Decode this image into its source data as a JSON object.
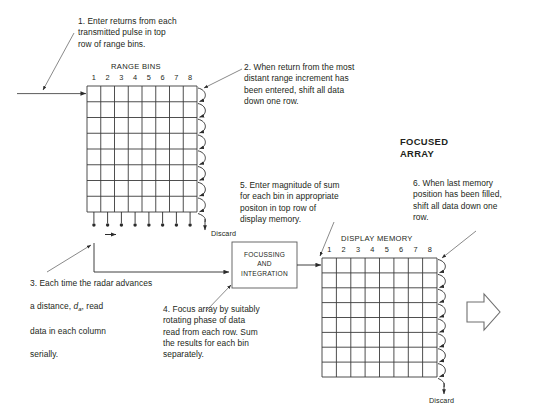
{
  "diagram": {
    "title_overlay": "FOCUSED ARRAY",
    "focused_array_label": "FOCUSED\nARRAY",
    "range_bins_label": "RANGE BINS",
    "display_memory_label": "DISPLAY MEMORY",
    "discard_label_left": "Discard",
    "discard_label_right": "Discard",
    "processor_box": "FOCUSSING\nAND\nINTEGRATION",
    "column_numbers": [
      "1",
      "2",
      "3",
      "4",
      "5",
      "6",
      "7",
      "8"
    ],
    "grid_rows": 8,
    "grid_cols": 8
  },
  "notes": [
    {
      "id": "note-1",
      "number": "1.",
      "text": "1. Enter returns from each\n    transmitted pulse in top\n    row of range bins."
    },
    {
      "id": "note-2",
      "number": "2.",
      "text": "2. When return from the most\n     distant range increment has\n     been entered, shift all data\n     down one row."
    },
    {
      "id": "note-3",
      "number": "3.",
      "text": "3. Each time the radar advances",
      "line2_pre": "    a distance, ",
      "line2_var": "d",
      "line2_sub": "a",
      "line2_post": ", read",
      "line3": "    data in each column",
      "line4": "    serially."
    },
    {
      "id": "note-4",
      "number": "4.",
      "text": "4. Focus array by suitably\n     rotating phase of data\n     read from each row. Sum\n     the results for each bin\n     separately."
    },
    {
      "id": "note-5",
      "number": "5.",
      "text": "5. Enter magnitude of sum\n     for each bin in appropriate\n     positon in top row of\n     display memory."
    },
    {
      "id": "note-6",
      "number": "6.",
      "text": "6. When last memory\n     position has been filled,\n     shift all data down one\n     row."
    }
  ],
  "colors": {
    "ink": "#231f20",
    "line": "#3a3a3a",
    "background": "#ffffff"
  }
}
